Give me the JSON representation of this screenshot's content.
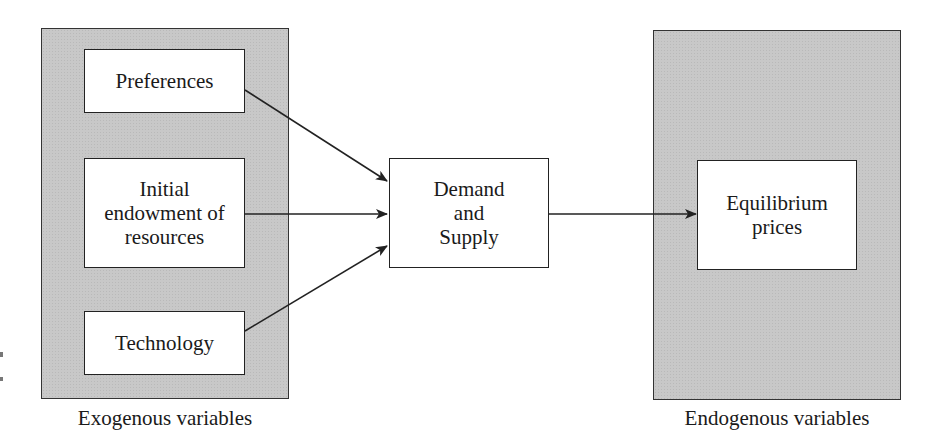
{
  "diagram": {
    "exogenous_panel": {
      "caption": "Exogenous variables",
      "items": [
        {
          "label": "Preferences"
        },
        {
          "label": "Initial\nendowment of\nresources"
        },
        {
          "label": "Technology"
        }
      ]
    },
    "center": {
      "label": "Demand\nand\nSupply"
    },
    "endogenous_panel": {
      "caption": "Endogenous variables",
      "items": [
        {
          "label": "Equilibrium\nprices"
        }
      ]
    },
    "edges": [
      {
        "from": "Preferences",
        "to": "Demand and Supply"
      },
      {
        "from": "Initial endowment of resources",
        "to": "Demand and Supply"
      },
      {
        "from": "Technology",
        "to": "Demand and Supply"
      },
      {
        "from": "Demand and Supply",
        "to": "Equilibrium prices"
      }
    ],
    "colors": {
      "panel_fill": "#c8c8c8",
      "line": "#222222",
      "box_fill": "#ffffff"
    }
  }
}
